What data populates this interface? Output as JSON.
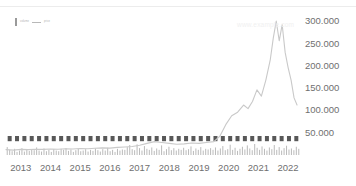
{
  "chart_data": {
    "type": "line",
    "title": "",
    "subtitle": "",
    "xlabel": "",
    "ylabel": "",
    "watermark": "www.example.com",
    "ylim": [
      0,
      325000
    ],
    "y_ticks": [
      50000,
      100000,
      150000,
      200000,
      250000,
      300000
    ],
    "y_tick_labels": [
      "50.000",
      "100.000",
      "150.000",
      "200.000",
      "250.000",
      "300.000"
    ],
    "x_tick_labels": [
      "2013",
      "2014",
      "2015",
      "2016",
      "2017",
      "2018",
      "2019",
      "2020",
      "2021",
      "2022"
    ],
    "x_range": [
      2013.0,
      2022.9
    ],
    "grid": false,
    "legend_position": "top-left",
    "series": [
      {
        "name": "price",
        "type": "line",
        "color": "#c9c9c9",
        "x": [
          2013.0,
          2013.25,
          2013.5,
          2013.75,
          2014.0,
          2014.25,
          2014.5,
          2014.75,
          2015.0,
          2015.25,
          2015.5,
          2015.75,
          2016.0,
          2016.25,
          2016.5,
          2016.75,
          2017.0,
          2017.25,
          2017.5,
          2017.75,
          2018.0,
          2018.25,
          2018.5,
          2018.75,
          2019.0,
          2019.25,
          2019.5,
          2019.75,
          2020.0,
          2020.2,
          2020.4,
          2020.6,
          2020.8,
          2021.0,
          2021.15,
          2021.3,
          2021.45,
          2021.6,
          2021.75,
          2021.9,
          2022.0,
          2022.1,
          2022.2,
          2022.3,
          2022.4,
          2022.5,
          2022.6,
          2022.7,
          2022.8
        ],
        "values": [
          12000,
          11000,
          12500,
          12000,
          13000,
          12500,
          13500,
          13000,
          14000,
          13500,
          14500,
          14000,
          15000,
          16000,
          15500,
          17000,
          18000,
          19000,
          22000,
          26000,
          30000,
          28000,
          26000,
          24000,
          25000,
          27000,
          26000,
          28000,
          30000,
          42000,
          68000,
          88000,
          96000,
          112000,
          104000,
          120000,
          146000,
          132000,
          168000,
          214000,
          262000,
          300000,
          256000,
          292000,
          230000,
          196000,
          168000,
          128000,
          112000
        ]
      },
      {
        "name": "volume",
        "type": "bar",
        "color": "#bcbcbc",
        "marker_color": "#585858",
        "categories_per_year": 12,
        "values": [
          46,
          30,
          22,
          36,
          18,
          26,
          40,
          20,
          30,
          24,
          34,
          28,
          44,
          26,
          20,
          38,
          22,
          30,
          18,
          34,
          26,
          22,
          36,
          30,
          40,
          24,
          32,
          18,
          28,
          36,
          22,
          26,
          34,
          20,
          30,
          24,
          38,
          28,
          20,
          34,
          26,
          42,
          22,
          30,
          18,
          36,
          26,
          32,
          30,
          46,
          58,
          34,
          28,
          62,
          40,
          26,
          52,
          36,
          30,
          44,
          24,
          38,
          30,
          56,
          22,
          34,
          48,
          28,
          40,
          26,
          36,
          30,
          42,
          28,
          34,
          50,
          24,
          38,
          30,
          46,
          26,
          36,
          32,
          40,
          30,
          44,
          26,
          38,
          52,
          28,
          34,
          60,
          30,
          42,
          24,
          36,
          48,
          32,
          56,
          38,
          28,
          64,
          42,
          30,
          50,
          36,
          26,
          44,
          34,
          58,
          30,
          46,
          26,
          40,
          54,
          32,
          38,
          28,
          48,
          36
        ]
      }
    ]
  },
  "legend": {
    "items": [
      {
        "marker": "bar-swatch",
        "label": "volume"
      },
      {
        "marker": "line-swatch",
        "label": "price"
      }
    ]
  },
  "axes": {
    "y_unit_note": "",
    "x_unit_note": ""
  }
}
